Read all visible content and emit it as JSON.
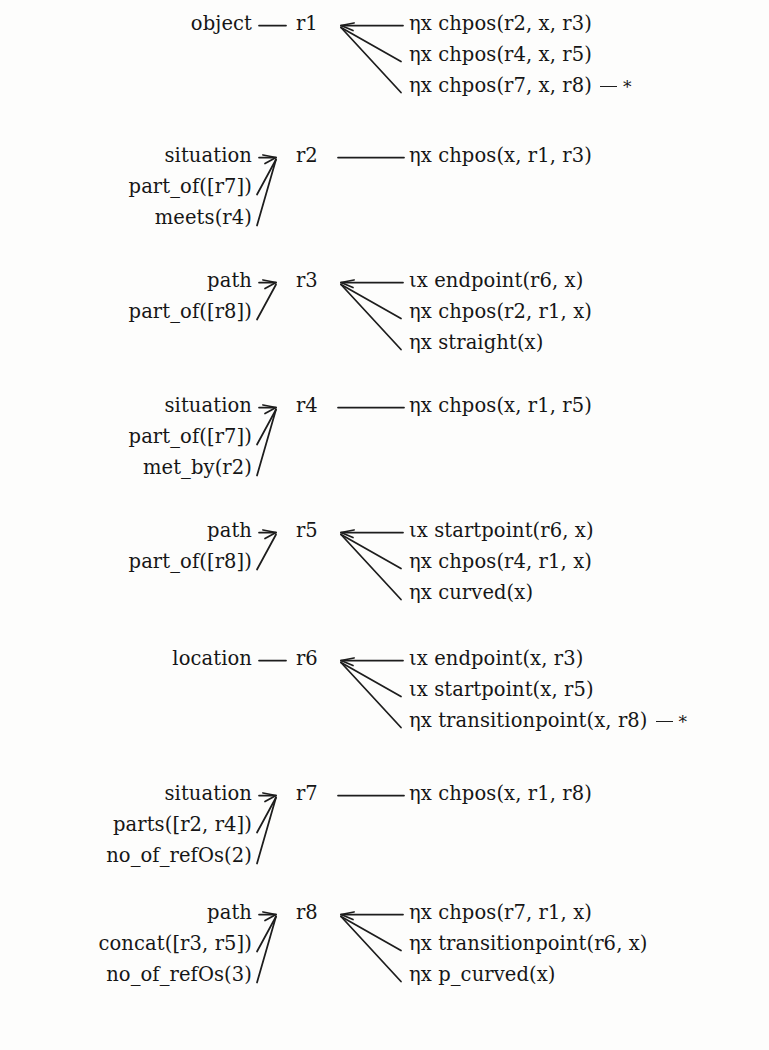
{
  "diagram": {
    "star_marker": "*",
    "blocks": [
      {
        "id": "r1",
        "node": "r1",
        "left_labels": [
          "object"
        ],
        "left_connector": "plain",
        "right_children": [
          {
            "text": "ηx chpos(r2, x, r3)",
            "star": false
          },
          {
            "text": "ηx chpos(r4, x, r5)",
            "star": false
          },
          {
            "text": "ηx chpos(r7, x, r8)",
            "star": true
          }
        ]
      },
      {
        "id": "r2",
        "node": "r2",
        "left_labels": [
          "situation",
          "part_of([r7])",
          "meets(r4)"
        ],
        "left_connector": "fan",
        "right_children": [
          {
            "text": "ηx chpos(x, r1, r3)",
            "star": false
          }
        ]
      },
      {
        "id": "r3",
        "node": "r3",
        "left_labels": [
          "path",
          "part_of([r8])"
        ],
        "left_connector": "fan",
        "right_children": [
          {
            "text": "ιx endpoint(r6, x)",
            "star": false
          },
          {
            "text": "ηx chpos(r2, r1, x)",
            "star": false
          },
          {
            "text": "ηx straight(x)",
            "star": false
          }
        ]
      },
      {
        "id": "r4",
        "node": "r4",
        "left_labels": [
          "situation",
          "part_of([r7])",
          "met_by(r2)"
        ],
        "left_connector": "fan",
        "right_children": [
          {
            "text": "ηx chpos(x, r1, r5)",
            "star": false
          }
        ]
      },
      {
        "id": "r5",
        "node": "r5",
        "left_labels": [
          "path",
          "part_of([r8])"
        ],
        "left_connector": "fan",
        "right_children": [
          {
            "text": "ιx startpoint(r6, x)",
            "star": false
          },
          {
            "text": "ηx chpos(r4, r1, x)",
            "star": false
          },
          {
            "text": "ηx curved(x)",
            "star": false
          }
        ]
      },
      {
        "id": "r6",
        "node": "r6",
        "left_labels": [
          "location"
        ],
        "left_connector": "plain",
        "right_children": [
          {
            "text": "ιx endpoint(x, r3)",
            "star": false
          },
          {
            "text": "ιx startpoint(x, r5)",
            "star": false
          },
          {
            "text": "ηx transitionpoint(x, r8)",
            "star": true
          }
        ]
      },
      {
        "id": "r7",
        "node": "r7",
        "left_labels": [
          "situation",
          "parts([r2, r4])",
          "no_of_refOs(2)"
        ],
        "left_connector": "fan",
        "right_children": [
          {
            "text": "ηx chpos(x, r1, r8)",
            "star": false
          }
        ]
      },
      {
        "id": "r8",
        "node": "r8",
        "left_labels": [
          "path",
          "concat([r3, r5])",
          "no_of_refOs(3)"
        ],
        "left_connector": "fan",
        "right_children": [
          {
            "text": "ηx chpos(r7, r1, x)",
            "star": false
          },
          {
            "text": "ηx transitionpoint(r6, x)",
            "star": false
          },
          {
            "text": "ηx p_curved(x)",
            "star": false
          }
        ]
      }
    ]
  }
}
